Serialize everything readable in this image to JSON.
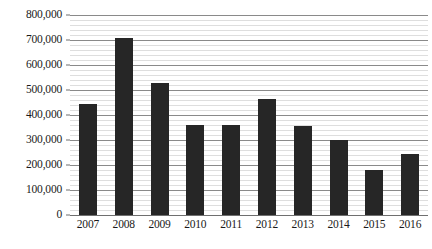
{
  "chart_data": {
    "type": "bar",
    "title": "",
    "subtitle": "",
    "xlabel": "",
    "ylabel": "",
    "categories": [
      "2007",
      "2008",
      "2009",
      "2010",
      "2011",
      "2012",
      "2013",
      "2014",
      "2015",
      "2016"
    ],
    "values": [
      445000,
      710000,
      530000,
      360000,
      360000,
      465000,
      358000,
      300000,
      180000,
      245000
    ],
    "ylim": [
      0,
      800000
    ],
    "ytick_values": [
      0,
      100000,
      200000,
      300000,
      400000,
      500000,
      600000,
      700000,
      800000
    ],
    "ytick_labels": [
      "0",
      "100,000",
      "200,000",
      "300,000",
      "400,000",
      "500,000",
      "600,000",
      "700,000",
      "800,000"
    ],
    "minor_ticks_per_interval": 5,
    "grid": true,
    "grid_axis": "y",
    "legend": false,
    "legend_position": "none",
    "series": [
      {
        "name": "",
        "color": "#262626",
        "values": [
          445000,
          710000,
          530000,
          360000,
          360000,
          465000,
          358000,
          300000,
          180000,
          245000
        ]
      }
    ],
    "colors": {
      "bar": "#262626",
      "major_gridline": "#8a8a8a",
      "minor_gridline": "#dedede",
      "axis": "#6f6f6f",
      "text": "#1a1a1a",
      "background": "#ffffff"
    }
  }
}
